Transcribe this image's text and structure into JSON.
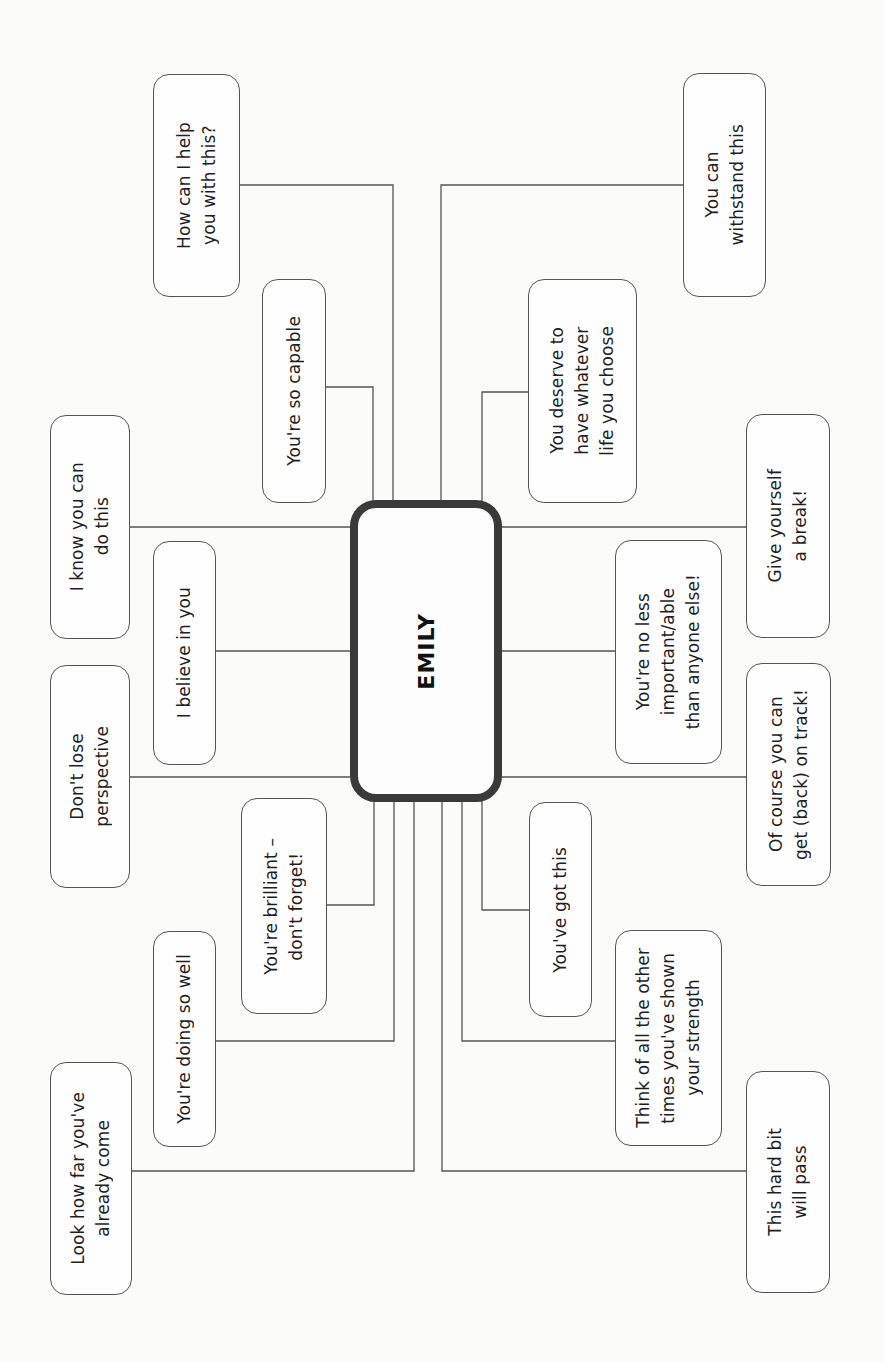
{
  "center": {
    "label": "EMILY"
  },
  "colors": {
    "line": "#555555",
    "center_border": "#3a3a3a",
    "background": "#fbfbfa"
  },
  "nodes": [
    {
      "id": "help",
      "text": "How can I help\nyou with this?"
    },
    {
      "id": "capable",
      "text": "You're so capable"
    },
    {
      "id": "withstand",
      "text": "You can\nwithstand this"
    },
    {
      "id": "deserve",
      "text": "You deserve to\nhave whatever\nlife you choose"
    },
    {
      "id": "know",
      "text": "I know you can\ndo this"
    },
    {
      "id": "believe",
      "text": "I believe in you"
    },
    {
      "id": "perspective",
      "text": "Don't lose\nperspective"
    },
    {
      "id": "break",
      "text": "Give yourself\na break!"
    },
    {
      "id": "noless",
      "text": "You're no less\nimportant/able\nthan anyone else!"
    },
    {
      "id": "ontrack",
      "text": "Of course you can\nget (back) on track!"
    },
    {
      "id": "brilliant",
      "text": "You're brilliant –\ndon't forget!"
    },
    {
      "id": "doingwell",
      "text": "You're doing so well"
    },
    {
      "id": "howfar",
      "text": "Look how far you've\nalready come"
    },
    {
      "id": "gotthis",
      "text": "You've got this"
    },
    {
      "id": "thinkof",
      "text": "Think of all the other\ntimes you've shown\nyour strength"
    },
    {
      "id": "hardbit",
      "text": "This hard bit\nwill pass"
    }
  ]
}
